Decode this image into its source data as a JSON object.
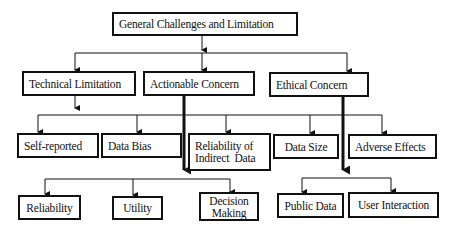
{
  "diagram": {
    "root": {
      "label": "General Challenges and Limitation"
    },
    "level1": [
      {
        "id": "technical",
        "label": "Technical Limitation"
      },
      {
        "id": "actionable",
        "label": "Actionable Concern"
      },
      {
        "id": "ethical",
        "label": "Ethical Concern"
      }
    ],
    "technical_children": [
      {
        "label": "Self-reported"
      },
      {
        "label": "Data Bias"
      },
      {
        "label": "Reliability of Indirect  Data"
      },
      {
        "label": "Data Size"
      },
      {
        "label": "Adverse Effects"
      }
    ],
    "actionable_children": [
      {
        "label": "Reliability"
      },
      {
        "label": "Utility"
      },
      {
        "label": "Decision Making"
      }
    ],
    "ethical_children": [
      {
        "label": "Public Data"
      },
      {
        "label": "User Interaction"
      }
    ],
    "colors": {
      "line": "#111111",
      "box_border": "#111111",
      "background": "#ffffff"
    }
  }
}
